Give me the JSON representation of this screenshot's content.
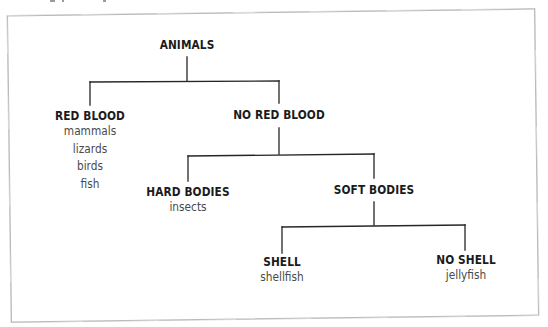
{
  "diagram": {
    "type": "classification-tree",
    "colors": {
      "title_text": "#1b1b1b",
      "item_text": "#4a4a4a",
      "edge": "#262626",
      "frame_border": "#b9b9b9",
      "background": "#ffffff"
    },
    "root": {
      "label": "ANIMALS"
    },
    "level1": {
      "red_blood": {
        "label": "RED BLOOD",
        "items": [
          "mammals",
          "lizards",
          "birds",
          "fish"
        ]
      },
      "no_red_blood": {
        "label": "NO RED BLOOD"
      }
    },
    "level2": {
      "hard_bodies": {
        "label": "HARD BODIES",
        "items": [
          "insects"
        ]
      },
      "soft_bodies": {
        "label": "SOFT BODIES"
      }
    },
    "level3": {
      "shell": {
        "label": "SHELL",
        "items": [
          "shellfish"
        ]
      },
      "no_shell": {
        "label": "NO SHELL",
        "items": [
          "jellyfish"
        ]
      }
    },
    "edges": [
      {
        "from": "ANIMALS",
        "to": "RED BLOOD"
      },
      {
        "from": "ANIMALS",
        "to": "NO RED BLOOD"
      },
      {
        "from": "NO RED BLOOD",
        "to": "HARD BODIES"
      },
      {
        "from": "NO RED BLOOD",
        "to": "SOFT BODIES"
      },
      {
        "from": "SOFT BODIES",
        "to": "SHELL"
      },
      {
        "from": "SOFT BODIES",
        "to": "NO SHELL"
      }
    ]
  }
}
